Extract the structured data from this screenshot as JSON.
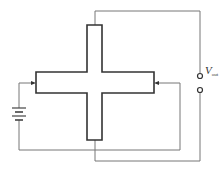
{
  "diagram": {
    "type": "hall-effect-cross-circuit",
    "output_label": {
      "symbol": "V",
      "subscript": "out"
    },
    "colors": {
      "cross_outline": "#333333",
      "wire": "#777777",
      "background": "#ffffff"
    },
    "components": [
      {
        "id": "cross-sample",
        "kind": "cross-shaped conductor"
      },
      {
        "id": "battery",
        "kind": "dc source"
      },
      {
        "id": "output-terminal-top",
        "kind": "terminal"
      },
      {
        "id": "output-terminal-bottom",
        "kind": "terminal"
      }
    ]
  }
}
